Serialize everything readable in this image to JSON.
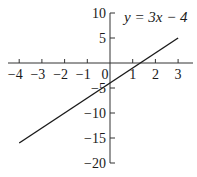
{
  "chart_data": {
    "type": "line",
    "title": "",
    "annotation": "y = 3x − 4",
    "equation": {
      "slope": 3,
      "intercept": -4
    },
    "series": [
      {
        "name": "y = 3x - 4",
        "x": [
          -4,
          3
        ],
        "y": [
          -16,
          5
        ]
      }
    ],
    "xlabel": "",
    "ylabel": "",
    "xlim": [
      -4.6,
      3.8
    ],
    "ylim": [
      -20,
      10
    ],
    "x_ticks": [
      -4,
      -3,
      -2,
      -1,
      0,
      1,
      2,
      3
    ],
    "x_tick_labels": [
      "−4",
      "−3",
      "−2",
      "−1",
      "0",
      "1",
      "2",
      "3"
    ],
    "y_ticks": [
      10,
      5,
      -5,
      -10,
      -15,
      -20
    ],
    "y_tick_labels": [
      "10",
      "5",
      "−5",
      "−10",
      "−15",
      "−20"
    ],
    "grid": false,
    "legend": "none",
    "colors": {
      "line": "#1a1a1a",
      "axes": "#333333"
    }
  }
}
